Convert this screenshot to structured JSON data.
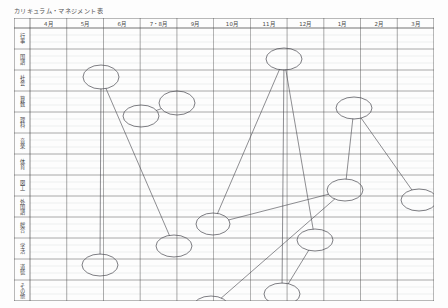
{
  "document": {
    "title": "カリキュラム・マネジメント表",
    "kind": "handwritten-annotated-table",
    "paper_color": "#fdfdfd",
    "ink_color": "#3a3a3a"
  },
  "table": {
    "corner_label": "",
    "column_headers": [
      "4月",
      "5月",
      "6月",
      "7・8月",
      "9月",
      "10月",
      "11月",
      "12月",
      "1月",
      "2月",
      "3月"
    ],
    "row_headers": [
      "行事",
      "国語",
      "社会",
      "算数",
      "理科",
      "音楽",
      "体育",
      "図工",
      "外国語",
      "総合",
      "学活",
      "道徳",
      "その他"
    ]
  },
  "chart_data": {
    "type": "table",
    "title": "カリキュラム・マネジメント表",
    "xlabel": "",
    "ylabel": "",
    "categories": [
      "4月",
      "5月",
      "6月",
      "7・8月",
      "9月",
      "10月",
      "11月",
      "12月",
      "1月",
      "2月",
      "3月"
    ],
    "rows": [
      "行事",
      "国語",
      "社会",
      "算数",
      "理科",
      "音楽",
      "体育",
      "図工",
      "外国語",
      "総合",
      "学活",
      "道徳",
      "その他"
    ],
    "grid": true,
    "legend": "none",
    "annotations": {
      "description": "Hand-drawn ellipses marking units placed at row/column intersections, joined by straight connector lines indicating cross-curricular links.",
      "ellipses": [
        {
          "id": "e1",
          "row": "国語",
          "column": "5月",
          "cx": 87,
          "cy": 59,
          "rx": 18,
          "ry": 12
        },
        {
          "id": "e2",
          "row": "算数",
          "column": "6月",
          "cx": 127,
          "cy": 98,
          "rx": 18,
          "ry": 11
        },
        {
          "id": "e3",
          "row": "社会",
          "column": "7・8月",
          "cx": 163,
          "cy": 85,
          "rx": 18,
          "ry": 12
        },
        {
          "id": "e4",
          "row": "行事",
          "column": "11月",
          "cx": 270,
          "cy": 41,
          "rx": 18,
          "ry": 11
        },
        {
          "id": "e5",
          "row": "音楽",
          "column": "1月",
          "cx": 340,
          "cy": 90,
          "rx": 18,
          "ry": 11
        },
        {
          "id": "e6",
          "row": "外国語",
          "column": "9月",
          "cx": 199,
          "cy": 206,
          "rx": 17,
          "ry": 11
        },
        {
          "id": "e7",
          "row": "総合",
          "column": "7・8月",
          "cx": 160,
          "cy": 228,
          "rx": 18,
          "ry": 11
        },
        {
          "id": "e8",
          "row": "外国語",
          "column": "1月",
          "cx": 331,
          "cy": 172,
          "rx": 18,
          "ry": 11
        },
        {
          "id": "e9",
          "row": "外国語",
          "column": "2月",
          "cx": 405,
          "cy": 182,
          "rx": 18,
          "ry": 11
        },
        {
          "id": "e10",
          "row": "学活",
          "column": "5月",
          "cx": 86,
          "cy": 247,
          "rx": 18,
          "ry": 11
        },
        {
          "id": "e11",
          "row": "総合",
          "column": "11月",
          "cx": 301,
          "cy": 222,
          "rx": 18,
          "ry": 11
        },
        {
          "id": "e12",
          "row": "その他",
          "column": "9月",
          "cx": 197,
          "cy": 289,
          "rx": 18,
          "ry": 11
        },
        {
          "id": "e13",
          "row": "学活",
          "column": "11月",
          "cx": 268,
          "cy": 276,
          "rx": 18,
          "ry": 11
        }
      ],
      "connectors": [
        {
          "from": "e1",
          "to": "e7"
        },
        {
          "from": "e2",
          "to": "e3"
        },
        {
          "from": "e4",
          "to": "e6"
        },
        {
          "from": "e4",
          "to": "e13"
        },
        {
          "from": "e4",
          "to": "e11"
        },
        {
          "from": "e5",
          "to": "e8"
        },
        {
          "from": "e5",
          "to": "e9"
        },
        {
          "from": "e6",
          "to": "e8"
        },
        {
          "from": "e11",
          "to": "e13"
        },
        {
          "from": "e12",
          "to": "e8"
        },
        {
          "from": "e1",
          "to": "e10"
        }
      ]
    }
  }
}
